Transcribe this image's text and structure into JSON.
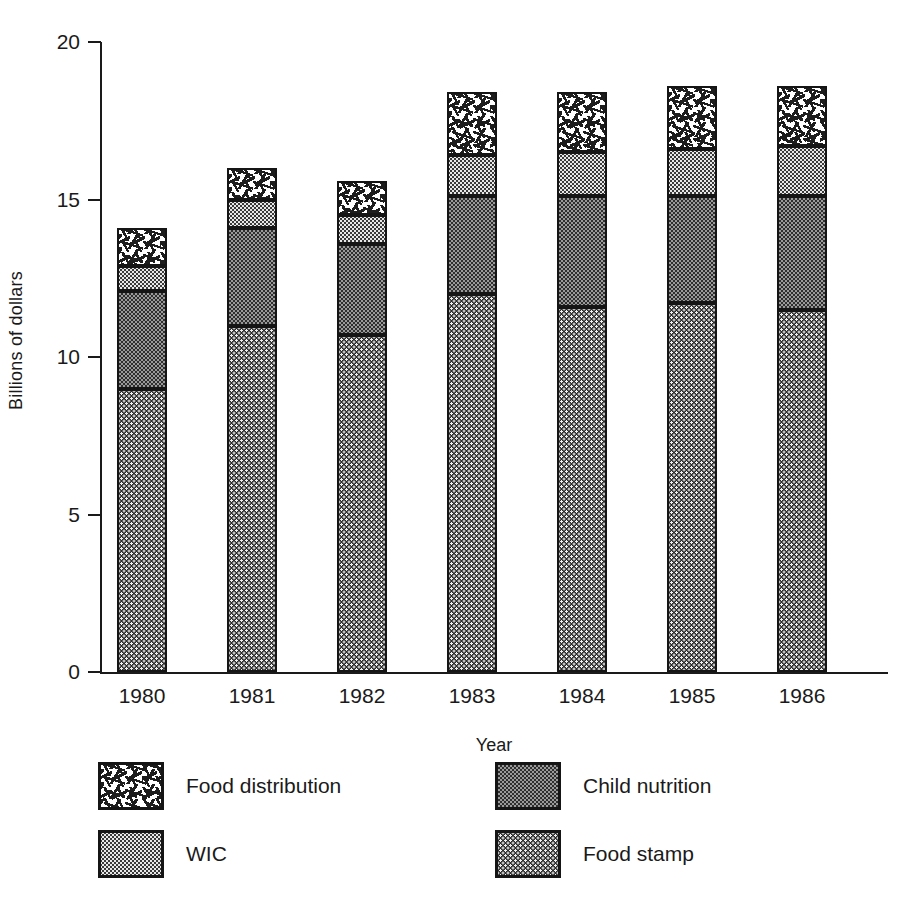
{
  "chart_data": {
    "type": "bar",
    "subtype": "stacked-bar",
    "title": "",
    "xlabel": "Year",
    "ylabel": "Billions of dollars",
    "categories": [
      "1980",
      "1981",
      "1982",
      "1983",
      "1984",
      "1985",
      "1986"
    ],
    "ylim": [
      0,
      20
    ],
    "yticks": [
      0,
      5,
      10,
      15,
      20
    ],
    "ytick_labels": [
      "0",
      "5",
      "10",
      "15",
      "20"
    ],
    "grid": false,
    "legend_position": "bottom",
    "stack_order_bottom_to_top": [
      "Food stamp",
      "Child nutrition",
      "WIC",
      "Food distribution"
    ],
    "series": [
      {
        "name": "Food stamp",
        "pattern": "dark-dot-screen",
        "values": [
          9.0,
          11.0,
          10.7,
          12.0,
          11.6,
          11.7,
          11.5
        ]
      },
      {
        "name": "Child nutrition",
        "pattern": "gray-checker",
        "values": [
          3.1,
          3.1,
          2.9,
          3.1,
          3.5,
          3.4,
          3.6
        ]
      },
      {
        "name": "WIC",
        "pattern": "light-dot-screen",
        "values": [
          0.8,
          0.9,
          0.9,
          1.3,
          1.4,
          1.5,
          1.6
        ]
      },
      {
        "name": "Food distribution",
        "pattern": "dash-speckle",
        "values": [
          1.2,
          1.0,
          1.1,
          2.0,
          1.9,
          2.0,
          1.9
        ]
      }
    ],
    "totals": [
      14.1,
      16.0,
      15.6,
      18.4,
      18.4,
      18.6,
      18.6
    ]
  },
  "legend": {
    "items": [
      {
        "label": "Food distribution",
        "series": "Food distribution"
      },
      {
        "label": "Child nutrition",
        "series": "Child nutrition"
      },
      {
        "label": "WIC",
        "series": "WIC"
      },
      {
        "label": "Food stamp",
        "series": "Food stamp"
      }
    ]
  },
  "colors": {
    "ink": "#1a1a1a",
    "background": "#ffffff",
    "food_stamp_fill": "#2b2b2b",
    "child_nutrition_fill": "#9a9a9a",
    "wic_fill": "#e8e8e8",
    "food_distribution_fill": "#ffffff"
  }
}
